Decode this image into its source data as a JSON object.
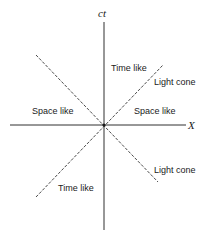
{
  "diagram": {
    "axes": {
      "vertical_label": "ct",
      "horizontal_label": "X"
    },
    "regions": {
      "time_like_upper": "Time like",
      "time_like_lower": "Time like",
      "space_like_left": "Space like",
      "space_like_right": "Space like"
    },
    "annotations": {
      "light_cone_upper": "Light cone",
      "light_cone_lower": "Light cone"
    },
    "colors": {
      "ink": "#1a1a1a",
      "background": "#ffffff"
    }
  }
}
